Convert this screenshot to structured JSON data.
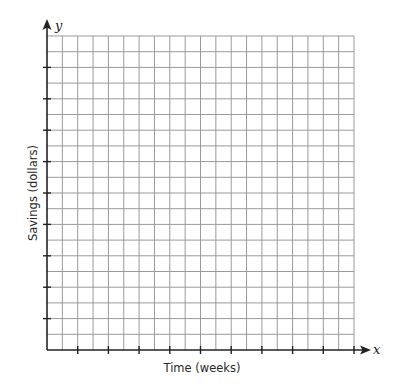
{
  "chart_data": {
    "type": "scatter",
    "title": "",
    "xlabel": "Time (weeks)",
    "ylabel": "Savings (dollars)",
    "x_axis_variable": "x",
    "y_axis_variable": "y",
    "grid": true,
    "grid_columns": 20,
    "grid_rows": 20,
    "x_tick_every_cells": 2,
    "y_tick_every_cells": 2,
    "x_tick_labels": [],
    "y_tick_labels": [],
    "series": [],
    "legend": null
  },
  "colors": {
    "grid": "#9a9a9a",
    "axis": "#222222",
    "background": "#ffffff"
  }
}
